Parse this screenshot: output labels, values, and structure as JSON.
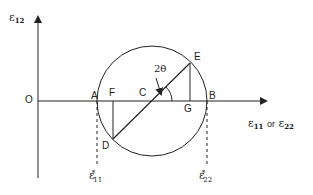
{
  "diagram": {
    "axes": {
      "y_label": {
        "symbol": "ε",
        "subscript": "12"
      },
      "x_label": {
        "symbol1": "ε",
        "sub1": "11",
        "connector": "or",
        "symbol2": "ε",
        "sub2": "22"
      },
      "origin": "O"
    },
    "points": {
      "A": "A",
      "B": "B",
      "C": "C",
      "D": "D",
      "E": "E",
      "F": "F",
      "G": "G"
    },
    "angle_label": "2θ",
    "principal_strains": [
      {
        "symbol": "ε",
        "sup": "*",
        "sub": "11"
      },
      {
        "symbol": "ε",
        "sup": "*",
        "sub": "22"
      }
    ],
    "colors": {
      "line": "#222222",
      "text": "#222222",
      "background": "#ffffff"
    }
  }
}
